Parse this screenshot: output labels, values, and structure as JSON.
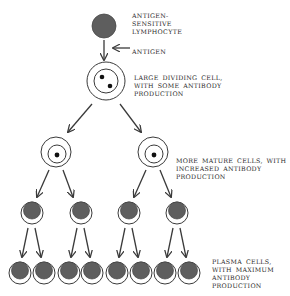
{
  "diagram": {
    "colors": {
      "cell_fill": "#5e5e5e",
      "line": "#3a3a3a",
      "nucleus": "#111111",
      "background": "#ffffff"
    },
    "labels": [
      {
        "id": "antigen-sensitive-lymphocyte",
        "text": "ANTIGEN-\nSENSITIVE\nLYMPHOCYTE",
        "x": 132,
        "y": 12
      },
      {
        "id": "antigen",
        "text": "ANTIGEN",
        "x": 132,
        "y": 48
      },
      {
        "id": "large-dividing-cell",
        "text": "LARGE DIVIDING CELL,\nWITH SOME ANTIBODY\nPRODUCTION",
        "x": 134,
        "y": 74
      },
      {
        "id": "more-mature-cells",
        "text": "MORE MATURE CELLS, WITH\nINCREASED ANTIBODY\nPRODUCTION",
        "x": 176,
        "y": 157
      },
      {
        "id": "plasma-cells",
        "text": "PLASMA CELLS,\nWITH MAXIMUM\nANTIBODY\nPRODUCTION",
        "x": 212,
        "y": 258
      }
    ],
    "stages": [
      {
        "name": "antigen-sensitive-lymphocyte",
        "type": "solid",
        "cells": [
          {
            "x": 104,
            "y": 26,
            "r": 12
          }
        ]
      },
      {
        "name": "large-dividing-cell",
        "type": "double-ring-two-nuclei",
        "cells": [
          {
            "x": 106,
            "y": 81,
            "r": 19,
            "ri": 12
          }
        ]
      },
      {
        "name": "more-mature-cells",
        "type": "double-ring-one-nucleus",
        "cells": [
          {
            "x": 56,
            "y": 152,
            "r": 15,
            "ri": 9
          },
          {
            "x": 153,
            "y": 152,
            "r": 15,
            "ri": 9
          }
        ]
      },
      {
        "name": "intermediate-plasma-cells",
        "type": "crescent",
        "cells": [
          {
            "x": 32,
            "y": 213,
            "r": 11
          },
          {
            "x": 81,
            "y": 213,
            "r": 11
          },
          {
            "x": 129,
            "y": 213,
            "r": 11
          },
          {
            "x": 177,
            "y": 213,
            "r": 11
          }
        ]
      },
      {
        "name": "plasma-cells",
        "type": "crescent",
        "cells": [
          {
            "x": 20,
            "y": 273,
            "r": 11
          },
          {
            "x": 44,
            "y": 273,
            "r": 11
          },
          {
            "x": 69,
            "y": 273,
            "r": 11
          },
          {
            "x": 92,
            "y": 273,
            "r": 11
          },
          {
            "x": 117,
            "y": 273,
            "r": 11
          },
          {
            "x": 141,
            "y": 273,
            "r": 11
          },
          {
            "x": 165,
            "y": 273,
            "r": 11
          },
          {
            "x": 189,
            "y": 273,
            "r": 11
          }
        ]
      }
    ],
    "arrows": [
      {
        "x1": 104,
        "y1": 40,
        "x2": 104,
        "y2": 60
      },
      {
        "x1": 130,
        "y1": 48,
        "x2": 113,
        "y2": 48
      },
      {
        "x1": 92,
        "y1": 104,
        "x2": 68,
        "y2": 132
      },
      {
        "x1": 120,
        "y1": 104,
        "x2": 141,
        "y2": 132
      },
      {
        "x1": 49,
        "y1": 170,
        "x2": 37,
        "y2": 197
      },
      {
        "x1": 63,
        "y1": 170,
        "x2": 73,
        "y2": 197
      },
      {
        "x1": 146,
        "y1": 170,
        "x2": 134,
        "y2": 197
      },
      {
        "x1": 160,
        "y1": 170,
        "x2": 171,
        "y2": 197
      },
      {
        "x1": 28,
        "y1": 228,
        "x2": 22,
        "y2": 257
      },
      {
        "x1": 35,
        "y1": 228,
        "x2": 41,
        "y2": 257
      },
      {
        "x1": 77,
        "y1": 228,
        "x2": 71,
        "y2": 257
      },
      {
        "x1": 84,
        "y1": 228,
        "x2": 90,
        "y2": 257
      },
      {
        "x1": 125,
        "y1": 228,
        "x2": 119,
        "y2": 257
      },
      {
        "x1": 132,
        "y1": 228,
        "x2": 138,
        "y2": 257
      },
      {
        "x1": 173,
        "y1": 228,
        "x2": 167,
        "y2": 257
      },
      {
        "x1": 180,
        "y1": 228,
        "x2": 186,
        "y2": 257
      }
    ]
  }
}
